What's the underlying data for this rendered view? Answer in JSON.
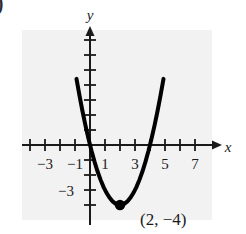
{
  "figure": {
    "corner_marker": ")",
    "background_color": "#ffffff",
    "panel_color": "#f2f2f2",
    "curve_color": "#000000",
    "axis_color": "#1a1a1a"
  },
  "chart_data": {
    "type": "line",
    "title": "",
    "subtitle": "",
    "xlabel": "x",
    "ylabel": "y",
    "xlim": [
      -4.5,
      8.5
    ],
    "ylim": [
      -5.2,
      7.5
    ],
    "grid": false,
    "legend": "none",
    "function": "y = (x - 2)^2 - 4",
    "x_ticks": [
      -4,
      -3,
      -2,
      -1,
      0,
      1,
      2,
      3,
      4,
      5,
      6,
      7,
      8
    ],
    "x_tick_labels": [
      "",
      "-3",
      "",
      "-1",
      "",
      "1",
      "",
      "3",
      "",
      "5",
      "",
      "7",
      ""
    ],
    "x_labeled_ticks": [
      {
        "value": -3,
        "text": "−3"
      },
      {
        "value": -1,
        "text": "−1"
      },
      {
        "value": 1,
        "text": "1"
      },
      {
        "value": 3,
        "text": "3"
      },
      {
        "value": 5,
        "text": "5"
      },
      {
        "value": 7,
        "text": "7"
      }
    ],
    "y_ticks": [
      -4,
      -3,
      -2,
      -1,
      1,
      2,
      3,
      4,
      5,
      6,
      7
    ],
    "y_labeled_ticks": [
      {
        "value": -3,
        "text": "−3"
      }
    ],
    "x": [
      -0.9,
      -0.7,
      -0.5,
      -0.3,
      -0.1,
      0.1,
      0.3,
      0.5,
      0.7,
      0.9,
      1.1,
      1.3,
      1.5,
      1.7,
      1.9,
      2.0,
      2.1,
      2.3,
      2.5,
      2.7,
      2.9,
      3.1,
      3.3,
      3.5,
      3.7,
      3.9,
      4.1,
      4.3,
      4.5,
      4.7,
      4.9
    ],
    "y": [
      4.41,
      3.29,
      2.25,
      1.29,
      0.41,
      -0.39,
      -1.11,
      -1.75,
      -2.31,
      -2.79,
      -3.19,
      -3.51,
      -3.75,
      -3.91,
      -3.99,
      -4.0,
      -3.99,
      -3.91,
      -3.75,
      -3.51,
      -3.19,
      -2.79,
      -2.31,
      -1.75,
      -1.11,
      -0.39,
      0.41,
      1.29,
      2.25,
      3.29,
      4.41
    ],
    "annotations": [
      {
        "type": "point",
        "label": "(2, −4)",
        "x": 2,
        "y": -4,
        "marker": "filled-circle"
      }
    ]
  }
}
